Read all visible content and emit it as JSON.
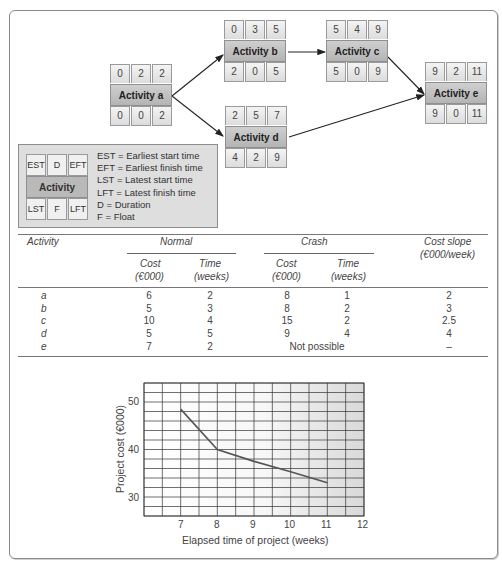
{
  "network": {
    "nodes": [
      {
        "id": "a",
        "label": "Activity a",
        "est": "0",
        "d": "2",
        "eft": "2",
        "lst": "0",
        "f": "0",
        "lft": "2"
      },
      {
        "id": "b",
        "label": "Activity b",
        "est": "0",
        "d": "3",
        "eft": "5",
        "lst": "2",
        "f": "0",
        "lft": "5"
      },
      {
        "id": "c",
        "label": "Activity c",
        "est": "5",
        "d": "4",
        "eft": "9",
        "lst": "5",
        "f": "0",
        "lft": "9"
      },
      {
        "id": "d",
        "label": "Activity d",
        "est": "2",
        "d": "5",
        "eft": "7",
        "lst": "4",
        "f": "2",
        "lft": "9"
      },
      {
        "id": "e",
        "label": "Activity e",
        "est": "9",
        "d": "2",
        "eft": "11",
        "lst": "9",
        "f": "0",
        "lft": "11"
      }
    ],
    "edges": [
      [
        "a",
        "b"
      ],
      [
        "a",
        "d"
      ],
      [
        "b",
        "c"
      ],
      [
        "c",
        "e"
      ],
      [
        "d",
        "e"
      ]
    ]
  },
  "legend": {
    "cells": {
      "est": "EST",
      "d": "D",
      "eft": "EFT",
      "label": "Activity",
      "lst": "LST",
      "f": "F",
      "lft": "LFT"
    },
    "definitions": [
      "EST = Earliest start time",
      "EFT = Earliest finish time",
      "LST = Latest start time",
      "LFT = Latest finish time",
      "D = Duration",
      "F = Float"
    ]
  },
  "table": {
    "headers": {
      "activity": "Activity",
      "normal": "Normal",
      "crash": "Crash",
      "cost_slope": "Cost slope",
      "cost_slope_unit": "(€000/week)",
      "cost": "Cost",
      "cost_unit": "(€000)",
      "time": "Time",
      "time_unit": "(weeks)"
    },
    "rows": [
      {
        "activity": "a",
        "normal_cost": "6",
        "normal_time": "2",
        "crash_cost": "8",
        "crash_time": "1",
        "slope": "2"
      },
      {
        "activity": "b",
        "normal_cost": "5",
        "normal_time": "3",
        "crash_cost": "8",
        "crash_time": "2",
        "slope": "3"
      },
      {
        "activity": "c",
        "normal_cost": "10",
        "normal_time": "4",
        "crash_cost": "15",
        "crash_time": "2",
        "slope": "2.5"
      },
      {
        "activity": "d",
        "normal_cost": "5",
        "normal_time": "5",
        "crash_cost": "9",
        "crash_time": "4",
        "slope": "4"
      },
      {
        "activity": "e",
        "normal_cost": "7",
        "normal_time": "2",
        "crash_text": "Not possible",
        "slope": "–"
      }
    ]
  },
  "chart_data": {
    "type": "line",
    "title": "",
    "xlabel": "Elapsed time of project (weeks)",
    "ylabel": "Project cost (€000)",
    "x": [
      7,
      8,
      9,
      10,
      11
    ],
    "series": [
      {
        "name": "Project cost",
        "values": [
          48.5,
          40,
          37.5,
          35.3,
          33
        ]
      }
    ],
    "xticks": [
      "7",
      "8",
      "9",
      "10",
      "11",
      "12"
    ],
    "yticks": [
      "30",
      "40",
      "50"
    ],
    "xlim": [
      6,
      12
    ],
    "ylim": [
      26,
      54
    ],
    "grid": true,
    "legend": "none"
  }
}
